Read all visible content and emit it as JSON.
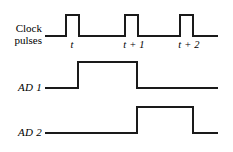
{
  "figure": {
    "kind": "digital-timing-diagram",
    "background_color": "#ffffff",
    "line_color": "#1a1a1a",
    "line_width_px": 2,
    "width_px": 233,
    "height_px": 152
  },
  "labels": {
    "clock_line1": "Clock",
    "clock_line2": "pulses",
    "ad1": "AD 1",
    "ad2": "AD 2"
  },
  "time_axis": {
    "ticks": [
      {
        "label": "t",
        "x_px": 72
      },
      {
        "label": "t + 1",
        "x_px": 134
      },
      {
        "label": "t + 2",
        "x_px": 189
      }
    ]
  },
  "chart_data": {
    "type": "line",
    "title": "",
    "xlabel": "",
    "ylabel": "",
    "grid": false,
    "legend_position": "left",
    "x_start_px": 45,
    "x_end_px": 218,
    "series": [
      {
        "name": "Clock pulses",
        "baseline_y_px": 36,
        "high_y_px": 15,
        "polyline": "45,36 66,36 66,15 79,15 79,36 125,36 125,15 138,15 138,36 180,36 180,15 193,15 193,36 218,36",
        "pulses": [
          {
            "rise_px": 66,
            "fall_px": 79
          },
          {
            "rise_px": 125,
            "fall_px": 138
          },
          {
            "rise_px": 180,
            "fall_px": 193
          }
        ]
      },
      {
        "name": "AD 1",
        "baseline_y_px": 88,
        "high_y_px": 62,
        "polyline": "45,88 78,88 78,62 137,62 137,88 218,88",
        "pulses": [
          {
            "rise_px": 78,
            "fall_px": 137
          }
        ]
      },
      {
        "name": "AD 2",
        "baseline_y_px": 133,
        "high_y_px": 107,
        "polyline": "45,133 137,133 137,107 193,107 193,133 218,133",
        "pulses": [
          {
            "rise_px": 137,
            "fall_px": 193
          }
        ]
      }
    ]
  }
}
